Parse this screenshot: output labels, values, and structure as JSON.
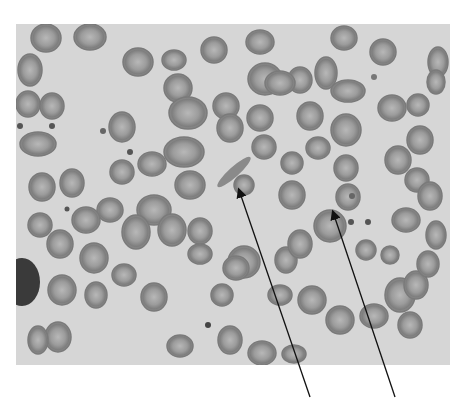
{
  "figure": {
    "type": "grayscale micrograph",
    "background_color": "#d6d6d6",
    "cell_color": "#8a8a8a",
    "cell_center_color": "#b4b4b4",
    "arrows": [
      {
        "id": "arrow-elongated-cell",
        "from": [
          310,
          397
        ],
        "to": [
          238,
          188
        ]
      },
      {
        "id": "arrow-target-cell",
        "from": [
          395,
          397
        ],
        "to": [
          332,
          210
        ]
      }
    ],
    "cells": [
      [
        46,
        38,
        15,
        14
      ],
      [
        90,
        37,
        16,
        13
      ],
      [
        30,
        70,
        12,
        16
      ],
      [
        28,
        104,
        12,
        13
      ],
      [
        52,
        106,
        12,
        13
      ],
      [
        38,
        144,
        18,
        12
      ],
      [
        138,
        62,
        15,
        14
      ],
      [
        174,
        60,
        12,
        10
      ],
      [
        178,
        88,
        14,
        14
      ],
      [
        188,
        113,
        19,
        16
      ],
      [
        184,
        152,
        20,
        15
      ],
      [
        152,
        164,
        14,
        12
      ],
      [
        122,
        127,
        13,
        15
      ],
      [
        122,
        172,
        12,
        12
      ],
      [
        214,
        50,
        13,
        13
      ],
      [
        260,
        42,
        14,
        12
      ],
      [
        265,
        79,
        17,
        16
      ],
      [
        300,
        80,
        12,
        13
      ],
      [
        344,
        38,
        13,
        12
      ],
      [
        383,
        52,
        13,
        13
      ],
      [
        438,
        62,
        10,
        15
      ],
      [
        226,
        106,
        13,
        13
      ],
      [
        260,
        118,
        13,
        13
      ],
      [
        280,
        83,
        15,
        12
      ],
      [
        326,
        73,
        11,
        16
      ],
      [
        348,
        91,
        17,
        11
      ],
      [
        310,
        116,
        13,
        14
      ],
      [
        346,
        130,
        15,
        16
      ],
      [
        392,
        108,
        14,
        13
      ],
      [
        418,
        105,
        11,
        11
      ],
      [
        420,
        140,
        13,
        14
      ],
      [
        436,
        82,
        9,
        12
      ],
      [
        398,
        160,
        13,
        14
      ],
      [
        417,
        180,
        12,
        12
      ],
      [
        230,
        128,
        13,
        14
      ],
      [
        264,
        147,
        12,
        12
      ],
      [
        318,
        148,
        12,
        11
      ],
      [
        292,
        163,
        11,
        11
      ],
      [
        292,
        195,
        13,
        14
      ],
      [
        346,
        168,
        12,
        13
      ],
      [
        348,
        197,
        12,
        13
      ],
      [
        244,
        185,
        10,
        10
      ],
      [
        190,
        185,
        15,
        14
      ],
      [
        154,
        210,
        17,
        15
      ],
      [
        110,
        210,
        13,
        12
      ],
      [
        72,
        183,
        12,
        14
      ],
      [
        42,
        187,
        13,
        14
      ],
      [
        40,
        225,
        12,
        12
      ],
      [
        86,
        220,
        14,
        13
      ],
      [
        60,
        244,
        13,
        14
      ],
      [
        94,
        258,
        14,
        15
      ],
      [
        62,
        290,
        14,
        15
      ],
      [
        96,
        295,
        11,
        13
      ],
      [
        58,
        337,
        13,
        15
      ],
      [
        38,
        340,
        10,
        14
      ],
      [
        172,
        230,
        14,
        16
      ],
      [
        200,
        231,
        12,
        13
      ],
      [
        136,
        232,
        14,
        17
      ],
      [
        124,
        275,
        12,
        11
      ],
      [
        154,
        297,
        13,
        14
      ],
      [
        180,
        346,
        13,
        11
      ],
      [
        244,
        262,
        16,
        16
      ],
      [
        286,
        260,
        11,
        13
      ],
      [
        300,
        244,
        12,
        14
      ],
      [
        330,
        226,
        16,
        16
      ],
      [
        312,
        300,
        14,
        14
      ],
      [
        340,
        320,
        14,
        14
      ],
      [
        374,
        316,
        14,
        12
      ],
      [
        400,
        295,
        15,
        17
      ],
      [
        416,
        285,
        12,
        14
      ],
      [
        410,
        325,
        12,
        13
      ],
      [
        428,
        264,
        11,
        13
      ],
      [
        436,
        235,
        10,
        14
      ],
      [
        406,
        220,
        14,
        12
      ],
      [
        430,
        196,
        12,
        14
      ],
      [
        262,
        353,
        14,
        12
      ],
      [
        294,
        354,
        12,
        9
      ],
      [
        366,
        250,
        10,
        10
      ],
      [
        390,
        255,
        9,
        9
      ],
      [
        200,
        254,
        12,
        10
      ],
      [
        222,
        295,
        11,
        11
      ],
      [
        236,
        268,
        13,
        12
      ],
      [
        280,
        295,
        12,
        10
      ],
      [
        230,
        340,
        12,
        14
      ]
    ]
  }
}
